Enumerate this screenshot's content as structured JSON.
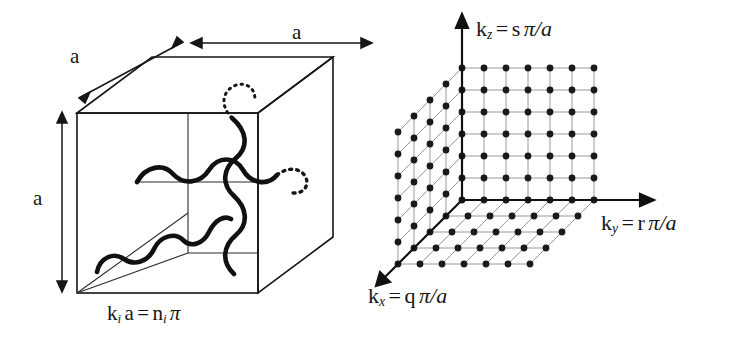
{
  "figure": {
    "background_color": "#ffffff",
    "ink_color": "#161616",
    "grid_line_color": "#8f8f8f",
    "dot_color": "#1a1a1a",
    "width": 733,
    "height": 348
  },
  "left_panel": {
    "name": "real-space-cube",
    "description": "Cube of side a containing three standing-wave modes along x, y and z",
    "side_length_symbol": "a",
    "dimension_labels": [
      {
        "id": "depth",
        "text": "a",
        "axis": "depth",
        "x": 70,
        "y": 46
      },
      {
        "id": "width",
        "text": "a",
        "axis": "horizontal",
        "x": 292,
        "y": 22
      },
      {
        "id": "height",
        "text": "a",
        "axis": "vertical",
        "x": 33,
        "y": 188
      }
    ],
    "caption": {
      "k": "k",
      "k_sub": "i",
      "a": "a",
      "equals": "=",
      "n": "n",
      "n_sub": "i",
      "pi": "π",
      "full_text": "k_i a = n_i π"
    },
    "waves": [
      {
        "id": "wave-vertical",
        "orientation": "vertical",
        "half_wavelengths": 5,
        "dotted_extension": "top"
      },
      {
        "id": "wave-horizontal",
        "orientation": "horizontal",
        "half_wavelengths": 4,
        "dotted_extension": "right"
      },
      {
        "id": "wave-diagonal",
        "orientation": "diagonal-depth",
        "half_wavelengths": 5,
        "dotted_extension": "none"
      }
    ]
  },
  "right_panel": {
    "name": "k-space-lattice",
    "description": "Three-dimensional lattice of allowed k states, spacing pi/a",
    "lattice": {
      "front_columns": 7,
      "front_rows": 7,
      "depth_layers": 5,
      "spacing_px": 22,
      "depth_step_x_px": -16,
      "depth_step_y_px": 16,
      "origin_x": 462,
      "origin_y": 200
    },
    "axes": [
      {
        "id": "axis-kz",
        "k": "k",
        "k_sub": "z",
        "equals": "=",
        "coefficient": "s",
        "unit": "π/a",
        "full_text": "k_z = s π/a",
        "direction": "up",
        "label_x": 476,
        "label_y": 18
      },
      {
        "id": "axis-ky",
        "k": "k",
        "k_sub": "y",
        "equals": "=",
        "coefficient": "r",
        "unit": "π/a",
        "full_text": "k_y = r π/a",
        "direction": "right",
        "label_x": 601,
        "label_y": 212
      },
      {
        "id": "axis-kx",
        "k": "k",
        "k_sub": "x",
        "equals": "=",
        "coefficient": "q",
        "unit": "π/a",
        "full_text": "k_x = q π/a",
        "direction": "down-left",
        "label_x": 368,
        "label_y": 285
      }
    ]
  }
}
